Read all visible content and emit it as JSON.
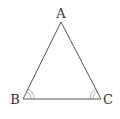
{
  "diagram": {
    "type": "geometry",
    "shape": "isosceles-triangle",
    "vertices": [
      {
        "id": "A",
        "label": "A",
        "x": 61,
        "y": 22
      },
      {
        "id": "B",
        "label": "B",
        "x": 23,
        "y": 99
      },
      {
        "id": "C",
        "label": "C",
        "x": 101,
        "y": 99
      }
    ],
    "edges": [
      [
        "A",
        "B"
      ],
      [
        "B",
        "C"
      ],
      [
        "C",
        "A"
      ]
    ],
    "angle_marks": [
      {
        "vertex": "B",
        "arcs": 2
      },
      {
        "vertex": "C",
        "arcs": 2
      }
    ],
    "colors": {
      "line": "#555555",
      "label": "#333333",
      "arc": "#8a8a8a"
    }
  }
}
